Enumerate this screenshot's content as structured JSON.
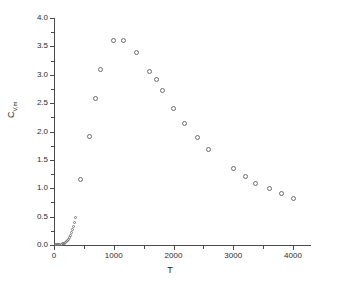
{
  "chart_data": {
    "type": "scatter",
    "title": "",
    "xlabel": "T",
    "ylabel": "C_V,m",
    "ylabel_base": "C",
    "ylabel_sub": "V,m",
    "xlim": [
      0,
      4220
    ],
    "ylim": [
      0.0,
      4.0
    ],
    "grid": false,
    "legend": null,
    "marker": "open-circle",
    "xticks": [
      0,
      1000,
      2000,
      3000,
      4000
    ],
    "xtick_labels": [
      "0",
      "1000",
      "2000",
      "3000",
      "4000"
    ],
    "xticks_minor": [
      500,
      1500,
      2500,
      3500
    ],
    "yticks": [
      0.0,
      0.5,
      1.0,
      1.5,
      2.0,
      2.5,
      3.0,
      3.5,
      4.0
    ],
    "ytick_labels": [
      "0.0",
      "0.5",
      "1.0",
      "1.5",
      "2.0",
      "2.5",
      "3.0",
      "3.5",
      "4.0"
    ],
    "yticks_minor": [
      0.25,
      0.75,
      1.25,
      1.75,
      2.25,
      2.75,
      3.25,
      3.75
    ],
    "series": [
      {
        "name": "Cv,m vs T",
        "points_small": [
          [
            20,
            0.003
          ],
          [
            40,
            0.004
          ],
          [
            60,
            0.006
          ],
          [
            80,
            0.008
          ],
          [
            100,
            0.01
          ],
          [
            120,
            0.014
          ],
          [
            140,
            0.018
          ],
          [
            160,
            0.024
          ],
          [
            180,
            0.032
          ],
          [
            200,
            0.045
          ],
          [
            215,
            0.06
          ],
          [
            230,
            0.08
          ],
          [
            245,
            0.105
          ],
          [
            260,
            0.135
          ],
          [
            275,
            0.17
          ],
          [
            290,
            0.215
          ],
          [
            305,
            0.265
          ],
          [
            320,
            0.33
          ],
          [
            335,
            0.4
          ],
          [
            352,
            0.487
          ]
        ],
        "points_big": [
          [
            440,
            1.16
          ],
          [
            600,
            1.92
          ],
          [
            700,
            2.59
          ],
          [
            780,
            3.1
          ],
          [
            1000,
            3.6
          ],
          [
            1160,
            3.61
          ],
          [
            1380,
            3.39
          ],
          [
            1600,
            3.06
          ],
          [
            1720,
            2.91
          ],
          [
            1820,
            2.73
          ],
          [
            2000,
            2.41
          ],
          [
            2180,
            2.14
          ],
          [
            2400,
            1.9
          ],
          [
            2580,
            1.68
          ],
          [
            3000,
            1.35
          ],
          [
            3200,
            1.21
          ],
          [
            3380,
            1.09
          ],
          [
            3600,
            0.99
          ],
          [
            3800,
            0.91
          ],
          [
            4000,
            0.82
          ]
        ]
      }
    ]
  }
}
